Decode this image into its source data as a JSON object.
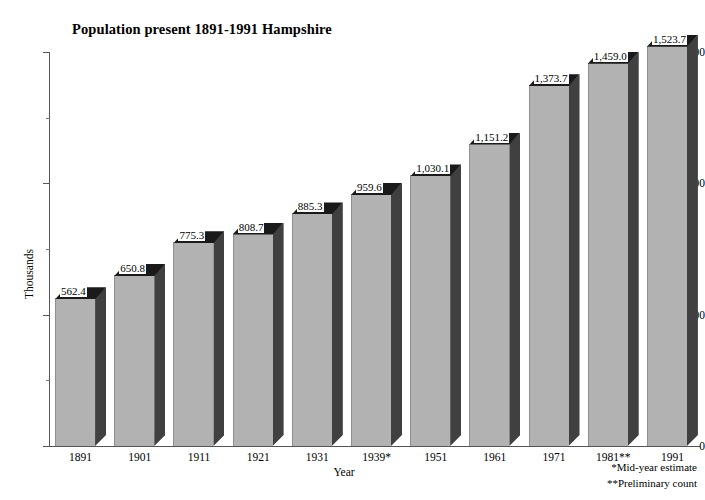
{
  "chart_data": {
    "type": "bar",
    "title": "Population present 1891-1991 Hampshire",
    "xlabel": "Year",
    "ylabel": "Thousands",
    "categories": [
      "1891",
      "1901",
      "1911",
      "1921",
      "1931",
      "1939*",
      "1951",
      "1961",
      "1971",
      "1981**",
      "1991"
    ],
    "values": [
      562.4,
      650.8,
      775.3,
      808.7,
      885.3,
      959.6,
      1030.1,
      1151.2,
      1373.7,
      1459.0,
      1523.7
    ],
    "value_labels": [
      "562.4",
      "650.8",
      "775.3",
      "808.7",
      "885.3",
      "959.6",
      "1,030.1",
      "1,151.2",
      "1,373.7",
      "1,459.0",
      "1,523.7"
    ],
    "ylim": [
      0,
      1500
    ],
    "y_ticks": [
      0,
      500,
      1000,
      1500
    ],
    "y_tick_labels": [
      "0",
      "500",
      "1,000",
      "1,500"
    ],
    "y_minor_ticks": [
      250,
      750,
      1250
    ],
    "grid": false,
    "legend": "none",
    "style": "3d-bar",
    "colors": {
      "bar_front": "#b2b2b2",
      "bar_side": "#404040",
      "bar_top": "#1a1a1a",
      "axis": "#555555",
      "text": "#000000",
      "background": "#ffffff"
    }
  },
  "footnotes": [
    "*Mid-year estimate",
    "**Preliminary count"
  ]
}
